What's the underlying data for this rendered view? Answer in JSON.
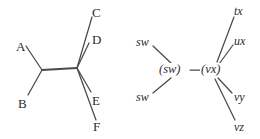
{
  "figure": {
    "type": "phylogenetic-tree-pair",
    "background_color": "#ffffff",
    "line_color": "#4a4a4a",
    "text_color": "#2b2b2b"
  },
  "left_tree": {
    "name": "unrooted-tree-left",
    "internal_nodes": [
      {
        "id": "n1",
        "x": 42,
        "y": 70,
        "label": ""
      },
      {
        "id": "n2",
        "x": 77,
        "y": 68,
        "label": ""
      }
    ],
    "leaves": [
      {
        "id": "A",
        "label": "A",
        "style": "roman",
        "x": 16,
        "y": 40,
        "tip_x": 26,
        "tip_y": 46,
        "from": "n1"
      },
      {
        "id": "B",
        "label": "B",
        "style": "roman",
        "x": 18,
        "y": 97,
        "tip_x": 27,
        "tip_y": 95,
        "from": "n1"
      },
      {
        "id": "C",
        "label": "C",
        "style": "roman",
        "x": 92,
        "y": 6,
        "tip_x": 92,
        "tip_y": 17,
        "from": "n2"
      },
      {
        "id": "D",
        "label": "D",
        "style": "roman",
        "x": 92,
        "y": 33,
        "tip_x": 88,
        "tip_y": 43,
        "from": "n2"
      },
      {
        "id": "E",
        "label": "E",
        "style": "roman",
        "x": 92,
        "y": 94,
        "tip_x": 91,
        "tip_y": 92,
        "from": "n2"
      },
      {
        "id": "F",
        "label": "F",
        "style": "roman",
        "x": 93,
        "y": 120,
        "tip_x": 95,
        "tip_y": 120,
        "from": "n2"
      }
    ],
    "edges": [
      {
        "from": "n1",
        "to": "n2",
        "thick": true
      },
      {
        "from": "n1",
        "to": "A",
        "thick": false
      },
      {
        "from": "n1",
        "to": "B",
        "thick": false
      },
      {
        "from": "n2",
        "to": "C",
        "thick": false
      },
      {
        "from": "n2",
        "to": "D",
        "thick": false
      },
      {
        "from": "n2",
        "to": "E",
        "thick": false
      },
      {
        "from": "n2",
        "to": "F",
        "thick": false
      }
    ]
  },
  "right_tree": {
    "name": "unrooted-tree-right",
    "internal_nodes": [
      {
        "id": "m1",
        "x": 176,
        "y": 70,
        "label": "(sw)"
      },
      {
        "id": "m2",
        "x": 213,
        "y": 70,
        "label": "(vx)"
      }
    ],
    "leaves": [
      {
        "id": "sw_top",
        "label": "sw",
        "style": "italic",
        "x": 136,
        "y": 36,
        "tip_x": 152,
        "tip_y": 46,
        "from": "m1"
      },
      {
        "id": "sw_bottom",
        "label": "sw",
        "style": "italic",
        "x": 136,
        "y": 91,
        "tip_x": 152,
        "tip_y": 94,
        "from": "m1"
      },
      {
        "id": "tx",
        "label": "tx",
        "style": "italic",
        "x": 234,
        "y": 5,
        "tip_x": 234,
        "tip_y": 17,
        "from": "m2"
      },
      {
        "id": "ux",
        "label": "ux",
        "style": "italic",
        "x": 234,
        "y": 35,
        "tip_x": 233,
        "tip_y": 45,
        "from": "m2"
      },
      {
        "id": "vy",
        "label": "vy",
        "style": "italic",
        "x": 234,
        "y": 91,
        "tip_x": 232,
        "tip_y": 93,
        "from": "m2"
      },
      {
        "id": "vz",
        "label": "vz",
        "style": "italic",
        "x": 234,
        "y": 121,
        "tip_x": 235,
        "tip_y": 120,
        "from": "m2"
      }
    ],
    "edges": [
      {
        "from": "m1",
        "to": "m2",
        "thick": false
      },
      {
        "from": "m1",
        "to": "sw_top",
        "thick": false
      },
      {
        "from": "m1",
        "to": "sw_bottom",
        "thick": false
      },
      {
        "from": "m2",
        "to": "tx",
        "thick": false
      },
      {
        "from": "m2",
        "to": "ux",
        "thick": false
      },
      {
        "from": "m2",
        "to": "vy",
        "thick": false
      },
      {
        "from": "m2",
        "to": "vz",
        "thick": false
      }
    ]
  }
}
